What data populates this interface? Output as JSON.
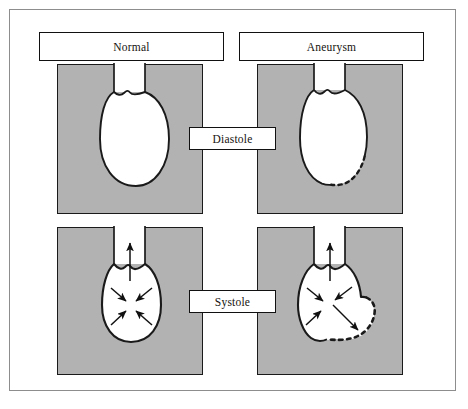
{
  "figure": {
    "frame_color": "#8d8d8d",
    "panel_fill": "#b2b2b2",
    "outline_color": "#1a1a1a",
    "chamber_fill": "#ffffff"
  },
  "columns": [
    {
      "id": "normal",
      "label": "Normal"
    },
    {
      "id": "aneurysm",
      "label": "Aneurysm"
    }
  ],
  "rows": [
    {
      "id": "diastole",
      "label": "Diastole"
    },
    {
      "id": "systole",
      "label": "Systole"
    }
  ],
  "panels": [
    {
      "id": "normal-diastole",
      "column": "normal",
      "row": "diastole",
      "chamber": "relaxed-oval-ventricle",
      "outflow_tract": "aorta-neck",
      "wall_style": "solid",
      "arrows": []
    },
    {
      "id": "aneurysm-diastole",
      "column": "aneurysm",
      "row": "diastole",
      "chamber": "relaxed-oval-ventricle",
      "outflow_tract": "aorta-neck",
      "wall_style": "solid-with-dashed-aneurysmal-segment",
      "dashed_segment_location": "inferior-lateral-wall",
      "arrows": []
    },
    {
      "id": "normal-systole",
      "column": "normal",
      "row": "systole",
      "chamber": "contracted-ventricle",
      "outflow_tract": "aorta-neck",
      "wall_style": "solid",
      "arrows": [
        {
          "name": "ejection-arrow",
          "direction": "up",
          "type": "outflow"
        },
        {
          "name": "contraction-arrow-upper-left",
          "direction": "down-right",
          "type": "inward"
        },
        {
          "name": "contraction-arrow-upper-right",
          "direction": "down-left",
          "type": "inward"
        },
        {
          "name": "contraction-arrow-lower-left",
          "direction": "up-right",
          "type": "inward"
        },
        {
          "name": "contraction-arrow-lower-right",
          "direction": "up-left",
          "type": "inward"
        }
      ]
    },
    {
      "id": "aneurysm-systole",
      "column": "aneurysm",
      "row": "systole",
      "chamber": "contracted-ventricle-with-paradoxical-bulge",
      "outflow_tract": "aorta-neck",
      "wall_style": "solid-with-dashed-aneurysmal-bulge",
      "dashed_segment_location": "inferior-lateral-bulge",
      "arrows": [
        {
          "name": "ejection-arrow",
          "direction": "up",
          "type": "outflow"
        },
        {
          "name": "contraction-arrow-upper-left",
          "direction": "down-right",
          "type": "inward"
        },
        {
          "name": "contraction-arrow-upper-right",
          "direction": "down-left",
          "type": "inward"
        },
        {
          "name": "contraction-arrow-lower-left",
          "direction": "up-right",
          "type": "inward"
        },
        {
          "name": "paradoxical-bulge-arrow",
          "direction": "down-right",
          "type": "outward"
        }
      ]
    }
  ]
}
